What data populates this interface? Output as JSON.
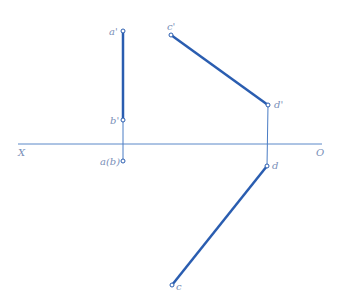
{
  "colors": {
    "line": "#2a5db0",
    "thin": "#4a7cc4",
    "axis": "#5a88c8",
    "label": "#7a8fb8"
  },
  "axis": {
    "x_label": "X",
    "o_label": "O",
    "y": 144,
    "x1": 18,
    "x2": 322
  },
  "points": {
    "a_prime": {
      "label": "a'",
      "x": 123,
      "y": 31
    },
    "b_prime": {
      "label": "b'",
      "x": 123,
      "y": 120
    },
    "ab": {
      "label": "a(b)",
      "x": 123,
      "y": 161
    },
    "c_prime": {
      "label": "c'",
      "x": 171,
      "y": 35
    },
    "d_prime": {
      "label": "d'",
      "x": 268,
      "y": 105
    },
    "d": {
      "label": "d",
      "x": 267,
      "y": 166
    },
    "c": {
      "label": "c",
      "x": 172,
      "y": 285
    }
  },
  "segments": [
    {
      "name": "a'b'",
      "from": "a_prime",
      "to": "b_prime",
      "type": "thick"
    },
    {
      "name": "c'd'",
      "from": "c_prime",
      "to": "d_prime",
      "type": "thick"
    },
    {
      "name": "cd",
      "from": "d",
      "to": "c",
      "type": "thick"
    },
    {
      "name": "projector-ab",
      "from": "b_prime",
      "to": "ab",
      "type": "thin"
    },
    {
      "name": "projector-cd",
      "from": "d_prime",
      "to": "d",
      "type": "thin"
    }
  ]
}
